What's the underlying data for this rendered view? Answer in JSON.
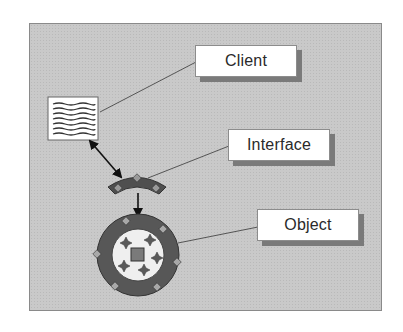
{
  "diagram": {
    "title": "",
    "labels": {
      "client": "Client",
      "interface": "Interface",
      "object": "Object"
    },
    "nodes": [
      {
        "id": "client",
        "shape": "document-icon",
        "label": "Client"
      },
      {
        "id": "interface",
        "shape": "arc-connector-icon",
        "label": "Interface"
      },
      {
        "id": "object",
        "shape": "ring-with-stars-icon",
        "label": "Object"
      }
    ],
    "edges": [
      {
        "from": "client",
        "to": "interface",
        "type": "bidirectional-arrow"
      },
      {
        "from": "interface",
        "to": "object",
        "type": "arrow"
      }
    ],
    "colors": {
      "panel_background": "#c9c9c9",
      "panel_border": "#8a8a8a",
      "label_box": "#ffffff",
      "label_shadow": "#7a7a7a",
      "ring_dark": "#555555",
      "ring_inner": "#f2f2f2",
      "arrow": "#111111",
      "connector_line": "#555555"
    }
  }
}
